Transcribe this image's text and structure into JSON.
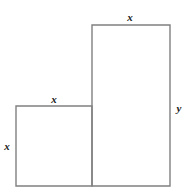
{
  "figure": {
    "background_color": "#ffffff",
    "stroke_color": "#808080",
    "label_color": "#1a1a1a",
    "shapes": [
      {
        "name": "small-square",
        "description": "Left lower square",
        "x": 16,
        "y": 106,
        "width": 76,
        "height": 80
      },
      {
        "name": "tall-rectangle",
        "description": "Right taller rectangle",
        "x": 92,
        "y": 25,
        "width": 78,
        "height": 161
      }
    ],
    "labels": [
      {
        "name": "tall-rect-top-label",
        "text": "x",
        "x": 130,
        "y": 17,
        "edge": "top edge of tall rectangle"
      },
      {
        "name": "square-top-label",
        "text": "x",
        "x": 54,
        "y": 99,
        "edge": "top edge of small square"
      },
      {
        "name": "square-left-label",
        "text": "x",
        "x": 7,
        "y": 146,
        "edge": "left edge of small square"
      },
      {
        "name": "tall-rect-right-label",
        "text": "y",
        "x": 179,
        "y": 108,
        "edge": "right edge of tall rectangle"
      }
    ]
  }
}
